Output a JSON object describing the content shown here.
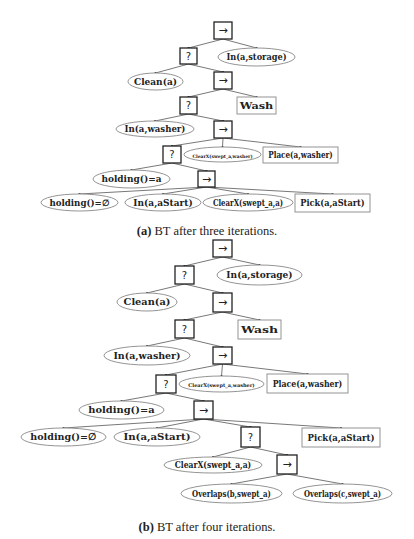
{
  "figure": {
    "subfigures": [
      {
        "id": "a",
        "caption_label": "(a)",
        "caption_text": " BT after three iterations.",
        "caption_y": 224,
        "nodes": [
          {
            "id": "a_root",
            "type": "sequence",
            "label": "→",
            "x": 214,
            "y": 22,
            "w": 18,
            "h": 17
          },
          {
            "id": "a_fb1",
            "type": "fallback",
            "label": "?",
            "x": 180,
            "y": 48,
            "w": 17,
            "h": 16
          },
          {
            "id": "a_in_storage",
            "type": "condition",
            "label": "In(a,storage)",
            "x": 218,
            "y": 48,
            "w": 77,
            "h": 18,
            "fs": 9
          },
          {
            "id": "a_clean",
            "type": "condition",
            "label": "Clean(a)",
            "x": 128,
            "y": 73,
            "w": 55,
            "h": 17,
            "fs": 9
          },
          {
            "id": "a_seq2",
            "type": "sequence",
            "label": "→",
            "x": 214,
            "y": 72,
            "w": 18,
            "h": 17
          },
          {
            "id": "a_fb2",
            "type": "fallback",
            "label": "?",
            "x": 180,
            "y": 97,
            "w": 17,
            "h": 17
          },
          {
            "id": "a_wash",
            "type": "action",
            "label": "Wash",
            "x": 237,
            "y": 97,
            "w": 39,
            "h": 17,
            "fs": 9
          },
          {
            "id": "a_in_washer",
            "type": "condition",
            "label": "In(a,washer)",
            "x": 116,
            "y": 121,
            "w": 78,
            "h": 16,
            "fs": 9
          },
          {
            "id": "a_seq3",
            "type": "sequence",
            "label": "→",
            "x": 214,
            "y": 121,
            "w": 18,
            "h": 17
          },
          {
            "id": "a_fb3",
            "type": "fallback",
            "label": "?",
            "x": 163,
            "y": 146,
            "w": 18,
            "h": 17
          },
          {
            "id": "a_clearx_washer",
            "type": "condition",
            "label": "ClearX(swept_a,washer)",
            "x": 184,
            "y": 147,
            "w": 77,
            "h": 15,
            "fs": 4.6
          },
          {
            "id": "a_place",
            "type": "action",
            "label": "Place(a,washer)",
            "x": 263,
            "y": 147,
            "w": 75,
            "h": 16,
            "fs": 9
          },
          {
            "id": "a_holding_a",
            "type": "condition",
            "label": "holding()=a",
            "x": 93,
            "y": 170,
            "w": 77,
            "h": 18,
            "fs": 9
          },
          {
            "id": "a_seq4",
            "type": "sequence",
            "label": "→",
            "x": 198,
            "y": 171,
            "w": 17,
            "h": 16
          },
          {
            "id": "a_holding_empty",
            "type": "condition",
            "label": "holding()=∅",
            "x": 41,
            "y": 194,
            "w": 77,
            "h": 17,
            "fs": 9
          },
          {
            "id": "a_in_astart",
            "type": "condition",
            "label": "In(a,aStart)",
            "x": 125,
            "y": 194,
            "w": 76,
            "h": 17,
            "fs": 9
          },
          {
            "id": "a_clearx_a",
            "type": "condition",
            "label": "ClearX(swept_a,a)",
            "x": 203,
            "y": 194,
            "w": 90,
            "h": 17,
            "fs": 9
          },
          {
            "id": "a_pick",
            "type": "action",
            "label": "Pick(a,aStart)",
            "x": 295,
            "y": 194,
            "w": 75,
            "h": 18,
            "fs": 9
          }
        ],
        "edges": [
          [
            "a_root",
            "a_fb1"
          ],
          [
            "a_root",
            "a_in_storage"
          ],
          [
            "a_fb1",
            "a_clean"
          ],
          [
            "a_fb1",
            "a_seq2"
          ],
          [
            "a_seq2",
            "a_fb2"
          ],
          [
            "a_seq2",
            "a_wash"
          ],
          [
            "a_fb2",
            "a_in_washer"
          ],
          [
            "a_fb2",
            "a_seq3"
          ],
          [
            "a_seq3",
            "a_fb3"
          ],
          [
            "a_seq3",
            "a_clearx_washer"
          ],
          [
            "a_seq3",
            "a_place"
          ],
          [
            "a_fb3",
            "a_holding_a"
          ],
          [
            "a_fb3",
            "a_seq4"
          ],
          [
            "a_seq4",
            "a_holding_empty"
          ],
          [
            "a_seq4",
            "a_in_astart"
          ],
          [
            "a_seq4",
            "a_clearx_a"
          ],
          [
            "a_seq4",
            "a_pick"
          ]
        ]
      },
      {
        "id": "b",
        "caption_label": "(b)",
        "caption_text": " BT after four iterations.",
        "caption_y": 520,
        "nodes": [
          {
            "id": "b_root",
            "type": "sequence",
            "label": "→",
            "x": 213,
            "y": 240,
            "w": 19,
            "h": 17
          },
          {
            "id": "b_fb1",
            "type": "fallback",
            "label": "?",
            "x": 175,
            "y": 266,
            "w": 19,
            "h": 18
          },
          {
            "id": "b_in_storage",
            "type": "condition",
            "label": "In(a,storage)",
            "x": 217,
            "y": 265,
            "w": 85,
            "h": 20,
            "fs": 10
          },
          {
            "id": "b_clean",
            "type": "condition",
            "label": "Clean(a)",
            "x": 117,
            "y": 293,
            "w": 60,
            "h": 18,
            "fs": 10
          },
          {
            "id": "b_seq2",
            "type": "sequence",
            "label": "→",
            "x": 213,
            "y": 293,
            "w": 19,
            "h": 19
          },
          {
            "id": "b_fb2",
            "type": "fallback",
            "label": "?",
            "x": 175,
            "y": 320,
            "w": 19,
            "h": 18
          },
          {
            "id": "b_wash",
            "type": "action",
            "label": "Wash",
            "x": 238,
            "y": 320,
            "w": 43,
            "h": 19,
            "fs": 10
          },
          {
            "id": "b_in_washer",
            "type": "condition",
            "label": "In(a,washer)",
            "x": 104,
            "y": 346,
            "w": 86,
            "h": 19,
            "fs": 10
          },
          {
            "id": "b_seq3",
            "type": "sequence",
            "label": "→",
            "x": 213,
            "y": 347,
            "w": 19,
            "h": 17
          },
          {
            "id": "b_fb3",
            "type": "fallback",
            "label": "?",
            "x": 156,
            "y": 375,
            "w": 20,
            "h": 18
          },
          {
            "id": "b_clearx_washer",
            "type": "condition",
            "label": "ClearX(swept_a,washer)",
            "x": 179,
            "y": 376,
            "w": 85,
            "h": 16,
            "fs": 5
          },
          {
            "id": "b_place",
            "type": "action",
            "label": "Place(a,washer)",
            "x": 267,
            "y": 374,
            "w": 81,
            "h": 19,
            "fs": 10
          },
          {
            "id": "b_holding_a",
            "type": "condition",
            "label": "holding()=a",
            "x": 79,
            "y": 401,
            "w": 85,
            "h": 18,
            "fs": 10
          },
          {
            "id": "b_seq4",
            "type": "sequence",
            "label": "→",
            "x": 194,
            "y": 401,
            "w": 19,
            "h": 18
          },
          {
            "id": "b_holding_empty",
            "type": "condition",
            "label": "holding()=∅",
            "x": 21,
            "y": 428,
            "w": 85,
            "h": 18,
            "fs": 10
          },
          {
            "id": "b_in_astart",
            "type": "condition",
            "label": "In(a,aStart)",
            "x": 114,
            "y": 428,
            "w": 86,
            "h": 18,
            "fs": 10
          },
          {
            "id": "b_fb4",
            "type": "fallback",
            "label": "?",
            "x": 241,
            "y": 427,
            "w": 19,
            "h": 20
          },
          {
            "id": "b_pick",
            "type": "action",
            "label": "Pick(a,aStart)",
            "x": 302,
            "y": 428,
            "w": 78,
            "h": 19,
            "fs": 10
          },
          {
            "id": "b_clearx_a",
            "type": "condition",
            "label": "ClearX(swept_a,a)",
            "x": 164,
            "y": 457,
            "w": 98,
            "h": 16,
            "fs": 10
          },
          {
            "id": "b_seq5",
            "type": "sequence",
            "label": "→",
            "x": 277,
            "y": 455,
            "w": 20,
            "h": 19
          },
          {
            "id": "b_overlaps_b",
            "type": "condition",
            "label": "Overlaps(b,swept_a)",
            "x": 181,
            "y": 484,
            "w": 101,
            "h": 19,
            "fs": 10
          },
          {
            "id": "b_overlaps_c",
            "type": "condition",
            "label": "Overlaps(c,swept_a)",
            "x": 293,
            "y": 484,
            "w": 99,
            "h": 19,
            "fs": 10
          }
        ],
        "edges": [
          [
            "b_root",
            "b_fb1"
          ],
          [
            "b_root",
            "b_in_storage"
          ],
          [
            "b_fb1",
            "b_clean"
          ],
          [
            "b_fb1",
            "b_seq2"
          ],
          [
            "b_seq2",
            "b_fb2"
          ],
          [
            "b_seq2",
            "b_wash"
          ],
          [
            "b_fb2",
            "b_in_washer"
          ],
          [
            "b_fb2",
            "b_seq3"
          ],
          [
            "b_seq3",
            "b_fb3"
          ],
          [
            "b_seq3",
            "b_clearx_washer"
          ],
          [
            "b_seq3",
            "b_place"
          ],
          [
            "b_fb3",
            "b_holding_a"
          ],
          [
            "b_fb3",
            "b_seq4"
          ],
          [
            "b_seq4",
            "b_holding_empty"
          ],
          [
            "b_seq4",
            "b_in_astart"
          ],
          [
            "b_seq4",
            "b_fb4"
          ],
          [
            "b_seq4",
            "b_pick"
          ],
          [
            "b_fb4",
            "b_clearx_a"
          ],
          [
            "b_fb4",
            "b_seq5"
          ],
          [
            "b_seq5",
            "b_overlaps_b"
          ],
          [
            "b_seq5",
            "b_overlaps_c"
          ]
        ]
      }
    ]
  },
  "legend": {
    "sequence_symbol": "→",
    "fallback_symbol": "?",
    "condition_shape": "ellipse",
    "action_shape": "rectangle"
  }
}
